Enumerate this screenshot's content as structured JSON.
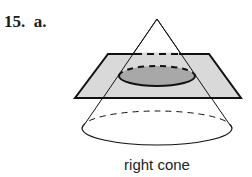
{
  "problem": {
    "number": "15.",
    "part": "a."
  },
  "figure": {
    "caption": "right cone",
    "colors": {
      "plane_fill": "#d9d9d9",
      "section_fill": "#a8a8a8",
      "stroke": "#111111"
    }
  }
}
